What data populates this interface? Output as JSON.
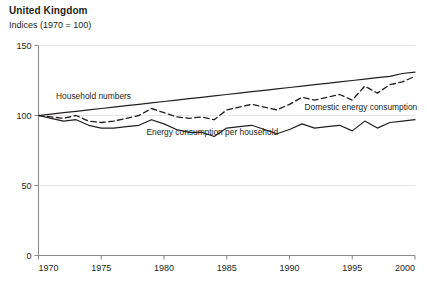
{
  "header": {
    "title": "United Kingdom",
    "subtitle": "Indices (1970 = 100)"
  },
  "chart_data": {
    "type": "line",
    "title": "United Kingdom",
    "subtitle": "Indices (1970 = 100)",
    "xlabel": "",
    "ylabel": "",
    "xlim": [
      1970,
      2000
    ],
    "ylim": [
      0,
      150
    ],
    "yticks": [
      0,
      50,
      100,
      150
    ],
    "ytick_labels": [
      "0",
      "50",
      "100",
      "150"
    ],
    "xticks": [
      1970,
      1975,
      1980,
      1985,
      1990,
      1995,
      2000
    ],
    "xtick_labels": [
      "1970",
      "1975",
      "1980",
      "1985",
      "1990",
      "1995",
      "2000"
    ],
    "grid": "horizontal",
    "legend_position": "inline-annotations",
    "x": [
      1970,
      1971,
      1972,
      1973,
      1974,
      1975,
      1976,
      1977,
      1978,
      1979,
      1980,
      1981,
      1982,
      1983,
      1984,
      1985,
      1986,
      1987,
      1988,
      1989,
      1990,
      1991,
      1992,
      1993,
      1994,
      1995,
      1996,
      1997,
      1998,
      1999,
      2000
    ],
    "series": [
      {
        "name": "Household numbers",
        "style": "solid",
        "color": "#231f20",
        "label_x": 1971.4,
        "label_y": 112,
        "values": [
          100,
          101,
          102,
          103,
          104,
          105,
          106,
          107,
          108,
          109,
          110,
          111,
          112,
          113,
          114,
          115,
          116,
          117,
          118,
          119,
          120,
          121,
          122,
          123,
          124,
          125,
          126,
          127,
          128,
          130,
          131
        ]
      },
      {
        "name": "Domestic energy consumption",
        "style": "dashed",
        "color": "#231f20",
        "label_x": 1991.2,
        "label_y": 104,
        "values": [
          100,
          99,
          98,
          100,
          96,
          95,
          96,
          98,
          100,
          105,
          102,
          99,
          98,
          99,
          97,
          104,
          106,
          108,
          106,
          104,
          108,
          113,
          111,
          113,
          115,
          111,
          121,
          116,
          122,
          124,
          128
        ]
      },
      {
        "name": "Energy consumption per household",
        "style": "solid",
        "color": "#231f20",
        "label_x": 1978.6,
        "label_y": 86,
        "values": [
          100,
          98,
          96,
          97,
          93,
          91,
          91,
          92,
          93,
          97,
          94,
          90,
          88,
          88,
          85,
          91,
          92,
          93,
          90,
          87,
          90,
          94,
          91,
          92,
          93,
          89,
          96,
          91,
          95,
          96,
          97
        ]
      }
    ]
  }
}
